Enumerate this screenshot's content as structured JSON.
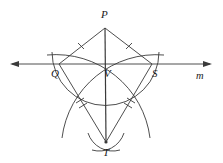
{
  "figure": {
    "type": "geometry-construction",
    "background_color": "#ffffff",
    "stroke_color": "#3a3a3a",
    "label_color": "#1b1b1b",
    "width": 223,
    "height": 163
  },
  "labels": {
    "p": "P",
    "q": "Q",
    "v": "V",
    "s": "S",
    "t": "T",
    "m": "m"
  },
  "points": {
    "p": {
      "x": 105,
      "y": 28
    },
    "q": {
      "x": 59,
      "y": 64
    },
    "v": {
      "x": 105,
      "y": 64
    },
    "s": {
      "x": 152,
      "y": 64
    },
    "t": {
      "x": 106,
      "y": 142
    }
  },
  "line_m": {
    "y": 64,
    "x_start": 10,
    "x_end": 212,
    "arrow_both_ends": true
  },
  "tick_marks": {
    "pq": 1,
    "ps": 1,
    "qt": 2,
    "st": 2
  }
}
